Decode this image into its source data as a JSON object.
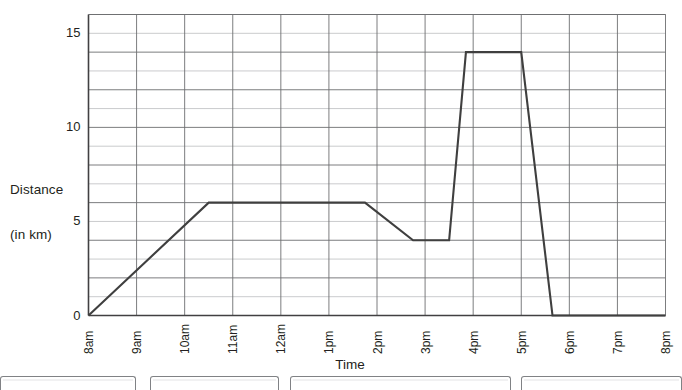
{
  "chart_data": {
    "type": "line",
    "title": "",
    "xlabel": "Time",
    "ylabel": "Distance (in km)",
    "ylabel_line1": "Distance",
    "ylabel_line2": "(in km)",
    "xlim": [
      8,
      20
    ],
    "ylim": [
      0,
      16
    ],
    "ytick_values": [
      0,
      5,
      10,
      15
    ],
    "ytick_labels": [
      "0",
      "5",
      "10",
      "15"
    ],
    "y_minor_step": 1,
    "x_minor_step": 1,
    "grid": true,
    "legend": "none",
    "xtick_labels": [
      "8am",
      "9am",
      "10am",
      "11am",
      "12am",
      "1pm",
      "2pm",
      "3pm",
      "4pm",
      "5pm",
      "6pm",
      "7pm",
      "8pm"
    ],
    "xtick_values": [
      8,
      9,
      10,
      11,
      12,
      13,
      14,
      15,
      16,
      17,
      18,
      19,
      20
    ],
    "series": [
      {
        "name": "Journey",
        "color": "#3f3f3f",
        "points": [
          {
            "time": "8am",
            "x": 8.0,
            "y": 0
          },
          {
            "time": "10:30am",
            "x": 10.5,
            "y": 6
          },
          {
            "time": "1:45pm",
            "x": 13.75,
            "y": 6
          },
          {
            "time": "2:45pm",
            "x": 14.75,
            "y": 4
          },
          {
            "time": "3:30pm",
            "x": 15.5,
            "y": 4
          },
          {
            "time": "3:50pm",
            "x": 15.85,
            "y": 14
          },
          {
            "time": "5pm",
            "x": 17.0,
            "y": 14
          },
          {
            "time": "5:40pm",
            "x": 17.65,
            "y": 0
          },
          {
            "time": "8pm",
            "x": 20.0,
            "y": 0
          }
        ]
      }
    ]
  },
  "style": {
    "line_color": "#3f3f3f",
    "grid_major_color": "#6d6e71",
    "grid_minor_color": "#bcbec0",
    "axis_color": "#414042",
    "text_color": "#231f20",
    "box_border_color": "#808285"
  },
  "answer_boxes": [
    {
      "label": "",
      "left": 0,
      "width": 136
    },
    {
      "label": "",
      "left": 150,
      "width": 129
    },
    {
      "label": "",
      "left": 290,
      "width": 221
    },
    {
      "label": "",
      "left": 521,
      "width": 161
    }
  ]
}
